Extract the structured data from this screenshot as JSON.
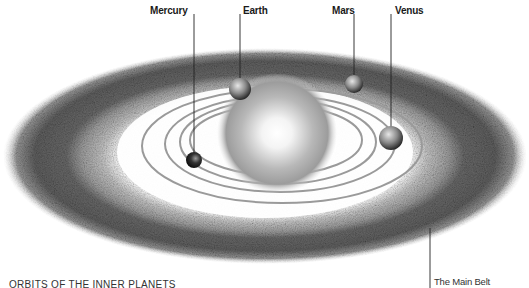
{
  "diagram": {
    "title": "ORBITS OF THE INNER PLANETS",
    "belt_label": "The Main Belt",
    "sun": {
      "name": "Sun"
    },
    "planets": [
      {
        "name": "Mercury",
        "label_x": 150,
        "line_x": 194,
        "cx": 194,
        "cy": 160,
        "r": 8,
        "tone": "#222222"
      },
      {
        "name": "Earth",
        "label_x": 242,
        "line_x": 240,
        "cx": 240,
        "cy": 89,
        "r": 11,
        "tone": "#8a8a8a"
      },
      {
        "name": "Mars",
        "label_x": 356,
        "line_x": 354,
        "cx": 354,
        "cy": 84,
        "r": 9,
        "tone": "#9a9a9a"
      },
      {
        "name": "Venus",
        "label_x": 394,
        "line_x": 391,
        "cx": 391,
        "cy": 138,
        "r": 12,
        "tone": "#8c8c8c"
      }
    ],
    "colors": {
      "belt_dark": "#5a5a5a",
      "belt_light": "#a8a8a8",
      "orbit": "#9a9a9a",
      "background": "#ffffff"
    }
  }
}
